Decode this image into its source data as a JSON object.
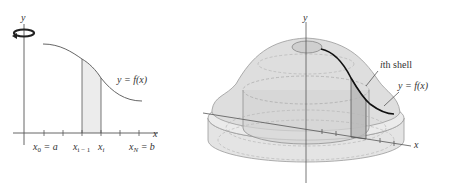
{
  "left_figure": {
    "y_axis_label": "y",
    "x_axis_label": "x",
    "curve_label": "y = f(x)",
    "tick_labels": {
      "x0": "x",
      "x0_sub": "0",
      "x0_eq": " = a",
      "xim1": "x",
      "xim1_sub": "i − 1",
      "xi": "x",
      "xi_sub": "i",
      "xN": "x",
      "xN_sub": "N",
      "xN_eq": " = b"
    },
    "rotation_icon": "rotation-arrow-icon"
  },
  "right_figure": {
    "y_axis_label": "y",
    "x_axis_label": "x",
    "shell_label_i": "i",
    "shell_label_rest": "th shell",
    "curve_label": "y = f(x)"
  },
  "colors": {
    "axis": "#555555",
    "curve": "#222222",
    "shade": "#e6e6e6",
    "solid_fill": "#dcdcdc",
    "solid_edge": "#9a9a9a"
  }
}
